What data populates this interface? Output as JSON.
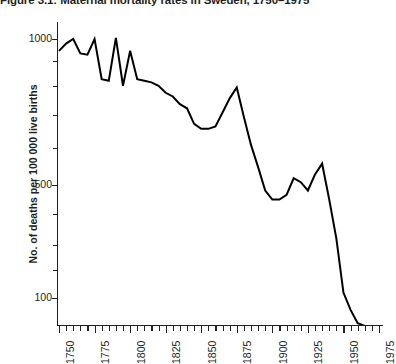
{
  "title": "Figure 3.1: Maternal mortality rates in Sweden, 1750–1975",
  "axes": {
    "y_title": "No. of deaths per 100 000 live births",
    "y_tick_labels": [
      "1000",
      "500",
      "100"
    ],
    "x_tick_labels": [
      "1750",
      "1775",
      "1800",
      "1825",
      "1850",
      "1875",
      "1900",
      "1925",
      "1950",
      "1975"
    ]
  },
  "chart_data": {
    "type": "line",
    "title": "Figure 3.1: Maternal mortality rates in Sweden, 1750–1975",
    "xlabel": "",
    "ylabel": "No. of deaths per 100 000 live births",
    "yscale": "log",
    "ylim": [
      60,
      1200
    ],
    "xlim": [
      1750,
      1975
    ],
    "grid": false,
    "legend": null,
    "y_ticks": [
      100,
      500,
      1000
    ],
    "y_minor_ticks": [
      200,
      300,
      400,
      600,
      700,
      800,
      900
    ],
    "x_ticks": [
      1750,
      1775,
      1800,
      1825,
      1850,
      1875,
      1900,
      1925,
      1950,
      1975
    ],
    "x_minor_tick_step": 5,
    "line_color": "#000000",
    "series": [
      {
        "name": "Maternal mortality rate",
        "x": [
          1750,
          1755,
          1760,
          1765,
          1770,
          1775,
          1780,
          1785,
          1790,
          1795,
          1800,
          1805,
          1810,
          1815,
          1820,
          1825,
          1830,
          1835,
          1840,
          1845,
          1850,
          1855,
          1860,
          1865,
          1870,
          1875,
          1880,
          1885,
          1890,
          1895,
          1900,
          1905,
          1910,
          1915,
          1920,
          1925,
          1930,
          1935,
          1940,
          1945,
          1950,
          1955,
          1960,
          1965,
          1970,
          1975
        ],
        "values": [
          900,
          960,
          1000,
          880,
          870,
          1000,
          700,
          690,
          1010,
          660,
          900,
          700,
          690,
          680,
          660,
          620,
          600,
          560,
          540,
          470,
          450,
          450,
          460,
          520,
          590,
          650,
          500,
          390,
          320,
          260,
          240,
          240,
          250,
          290,
          280,
          260,
          300,
          330,
          240,
          170,
          105,
          90,
          80,
          78,
          76,
          75
        ]
      }
    ]
  },
  "geometry": {
    "y_axis": {
      "top": 22,
      "bottom": 325,
      "pos_1000": 39,
      "pos_500": 185,
      "pos_100": 298
    },
    "x_axis": {
      "left": 57,
      "right": 383,
      "pos_1750": 59,
      "pos_1975": 379
    },
    "polyline": "1,68 8,55 14,40 22,66 28,68 37,38 44,75 51,77 60,36 66,80 75,47 82,75 89,76 96,77 103,80 110,86 117,89 124,96 131,100 137,112 144,118 151,118 158,115 165,104 172,95 179,86 186,106 193,128 200,146 207,164 214,172 221,172 228,168 235,156 242,159 249,164 256,150 263,142 270,168 277,199 284,243 291,258 298,269 305,272 312,275 320,277"
  }
}
